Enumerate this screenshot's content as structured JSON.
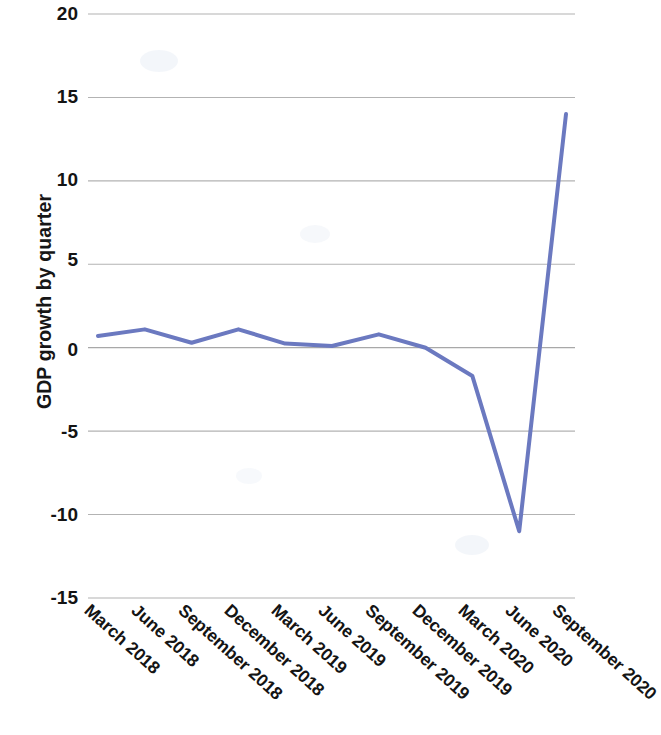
{
  "chart_data": {
    "type": "line",
    "title": "",
    "xlabel": "",
    "ylabel": "GDP growth by quarter",
    "categories": [
      "March 2018",
      "June 2018",
      "September 2018",
      "December 2018",
      "March 2019",
      "June 2019",
      "September 2019",
      "December 2019",
      "March 2020",
      "June 2020",
      "September 2020"
    ],
    "values": [
      0.7,
      1.1,
      0.3,
      1.1,
      0.25,
      0.1,
      0.8,
      0.0,
      -1.7,
      -11.0,
      14.0
    ],
    "series": [
      {
        "name": "GDP growth by quarter",
        "values": [
          0.7,
          1.1,
          0.3,
          1.1,
          0.25,
          0.1,
          0.8,
          0.0,
          -1.7,
          -11.0,
          14.0
        ]
      }
    ],
    "ylim": [
      -15,
      20
    ],
    "ytick_values": [
      20,
      15,
      10,
      5,
      0,
      -5,
      -10,
      -15
    ],
    "ytick_labels": [
      "20",
      "15",
      "10",
      "5",
      "0",
      "-5",
      "-10",
      "-15"
    ],
    "grid": true,
    "grid_axis": "y",
    "legend": false,
    "legend_position": "none",
    "line_color": "#6B79C0",
    "grid_color": "#9a9a9a",
    "line_width": 4
  }
}
